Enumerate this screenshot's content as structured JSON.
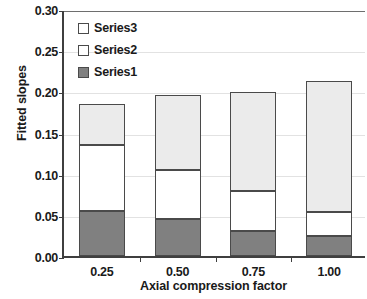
{
  "chart_data": {
    "type": "bar",
    "subtype": "stacked",
    "title": "",
    "xlabel": "Axial compression factor",
    "ylabel": "Fitted slopes",
    "categories": [
      "0.25",
      "0.50",
      "0.75",
      "1.00"
    ],
    "series": [
      {
        "name": "Series1",
        "values": [
          0.055,
          0.045,
          0.03,
          0.024
        ],
        "color": "#808080"
      },
      {
        "name": "Series2",
        "values": [
          0.08,
          0.06,
          0.049,
          0.029
        ],
        "color": "#ffffff"
      },
      {
        "name": "Series3",
        "values": [
          0.05,
          0.09,
          0.12,
          0.16
        ],
        "color": "#ebebeb"
      }
    ],
    "totals": [
      0.185,
      0.195,
      0.199,
      0.213
    ],
    "ylim": [
      0.0,
      0.3
    ],
    "yticks": [
      "0.00",
      "0.05",
      "0.10",
      "0.15",
      "0.20",
      "0.25",
      "0.30"
    ],
    "ytick_values": [
      0.0,
      0.05,
      0.1,
      0.15,
      0.2,
      0.25,
      0.3
    ],
    "xticks": [
      "0.25",
      "0.50",
      "0.75",
      "1.00"
    ],
    "grid": true,
    "grid_axis": "y",
    "legend_position": "top-left",
    "legend": [
      "Series3",
      "Series2",
      "Series1"
    ],
    "axis_color": "#3f3f3f",
    "grid_color": "#e2e2e2",
    "bar_border_color": "#4a4a4a"
  }
}
